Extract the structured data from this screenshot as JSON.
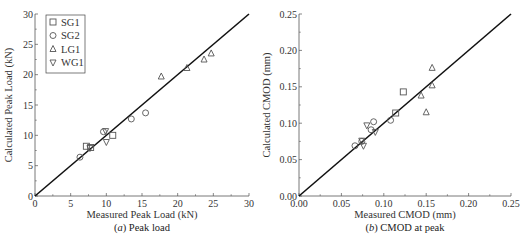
{
  "chart_data": [
    {
      "type": "scatter",
      "panel": "a",
      "caption_prefix": "(a)",
      "caption": "Peak load",
      "title": "",
      "xlabel": "Measured Peak Load (kN)",
      "ylabel": "Calculated Peak Load (kN)",
      "xlim": [
        0,
        30
      ],
      "ylim": [
        0,
        30
      ],
      "xticks": [
        "0",
        "5",
        "10",
        "15",
        "20",
        "25",
        "30"
      ],
      "yticks": [
        "0",
        "5",
        "10",
        "15",
        "20",
        "25",
        "30"
      ],
      "grid": false,
      "reference_line": "y = x",
      "legend_position": "upper left",
      "series": [
        {
          "name": "SG1",
          "marker": "square",
          "points": [
            [
              7.2,
              8.2
            ],
            [
              7.8,
              8.0
            ],
            [
              10.9,
              10.0
            ]
          ]
        },
        {
          "name": "SG2",
          "marker": "circle",
          "points": [
            [
              6.3,
              6.4
            ],
            [
              9.6,
              10.6
            ],
            [
              13.5,
              12.7
            ],
            [
              15.5,
              13.7
            ]
          ]
        },
        {
          "name": "LG1",
          "marker": "triangle-up",
          "points": [
            [
              17.7,
              19.7
            ],
            [
              21.3,
              21.1
            ],
            [
              23.7,
              22.5
            ],
            [
              24.7,
              23.5
            ]
          ]
        },
        {
          "name": "WG1",
          "marker": "triangle-down",
          "points": [
            [
              9.9,
              10.7
            ],
            [
              10.0,
              8.9
            ],
            [
              7.7,
              7.9
            ]
          ]
        }
      ]
    },
    {
      "type": "scatter",
      "panel": "b",
      "caption_prefix": "(b)",
      "caption": "CMOD at peak",
      "title": "",
      "xlabel": "Measured CMOD (mm)",
      "ylabel": "Calculated CMOD (mm)",
      "xlim": [
        0,
        0.25
      ],
      "ylim": [
        0,
        0.25
      ],
      "xticks": [
        "0.00",
        "0.05",
        "0.10",
        "0.15",
        "0.20",
        "0.25"
      ],
      "yticks": [
        "0.00",
        "0.05",
        "0.10",
        "0.15",
        "0.20",
        "0.25"
      ],
      "grid": false,
      "reference_line": "y = x",
      "series": [
        {
          "name": "SG1",
          "marker": "square",
          "points": [
            [
              0.114,
              0.114
            ],
            [
              0.123,
              0.143
            ]
          ]
        },
        {
          "name": "SG2",
          "marker": "circle",
          "points": [
            [
              0.066,
              0.069
            ],
            [
              0.074,
              0.075
            ],
            [
              0.085,
              0.091
            ],
            [
              0.088,
              0.102
            ],
            [
              0.108,
              0.104
            ]
          ]
        },
        {
          "name": "LG1",
          "marker": "triangle-up",
          "points": [
            [
              0.157,
              0.176
            ],
            [
              0.157,
              0.152
            ],
            [
              0.144,
              0.138
            ],
            [
              0.15,
              0.115
            ]
          ]
        },
        {
          "name": "WG1",
          "marker": "triangle-down",
          "points": [
            [
              0.08,
              0.097
            ],
            [
              0.09,
              0.088
            ],
            [
              0.076,
              0.069
            ],
            [
              0.074,
              0.076
            ]
          ]
        }
      ]
    }
  ],
  "style": {
    "line_color": "#111111",
    "marker_color": "#555555",
    "axis_color": "#555555"
  }
}
